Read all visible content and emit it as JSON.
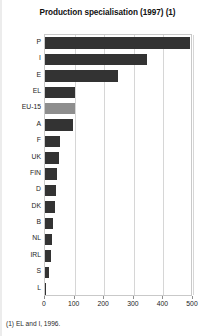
{
  "chart_data": {
    "type": "bar",
    "orientation": "horizontal",
    "title": "Production specialisation (1997) (1)",
    "xlabel": "",
    "ylabel": "",
    "categories": [
      "P",
      "I",
      "E",
      "EL",
      "EU-15",
      "A",
      "F",
      "UK",
      "FIN",
      "D",
      "DK",
      "B",
      "NL",
      "IRL",
      "S",
      "L"
    ],
    "values": [
      490,
      345,
      248,
      103,
      100,
      95,
      52,
      46,
      41,
      38,
      35,
      26,
      22,
      20,
      12,
      4
    ],
    "highlight_category": "EU-15",
    "xlim": [
      0,
      500
    ],
    "xticks": [
      0,
      100,
      200,
      300,
      400,
      500
    ],
    "xtick_labels": [
      "0",
      "100",
      "200",
      "300",
      "400",
      "500"
    ],
    "grid": true,
    "grid_axis": "x",
    "legend": false,
    "bar_color": "#333333",
    "highlight_color": "#8e8e8e",
    "footnote": "(1) EL and I, 1996."
  },
  "footnote": {
    "text": "(1) EL and I, 1996."
  }
}
